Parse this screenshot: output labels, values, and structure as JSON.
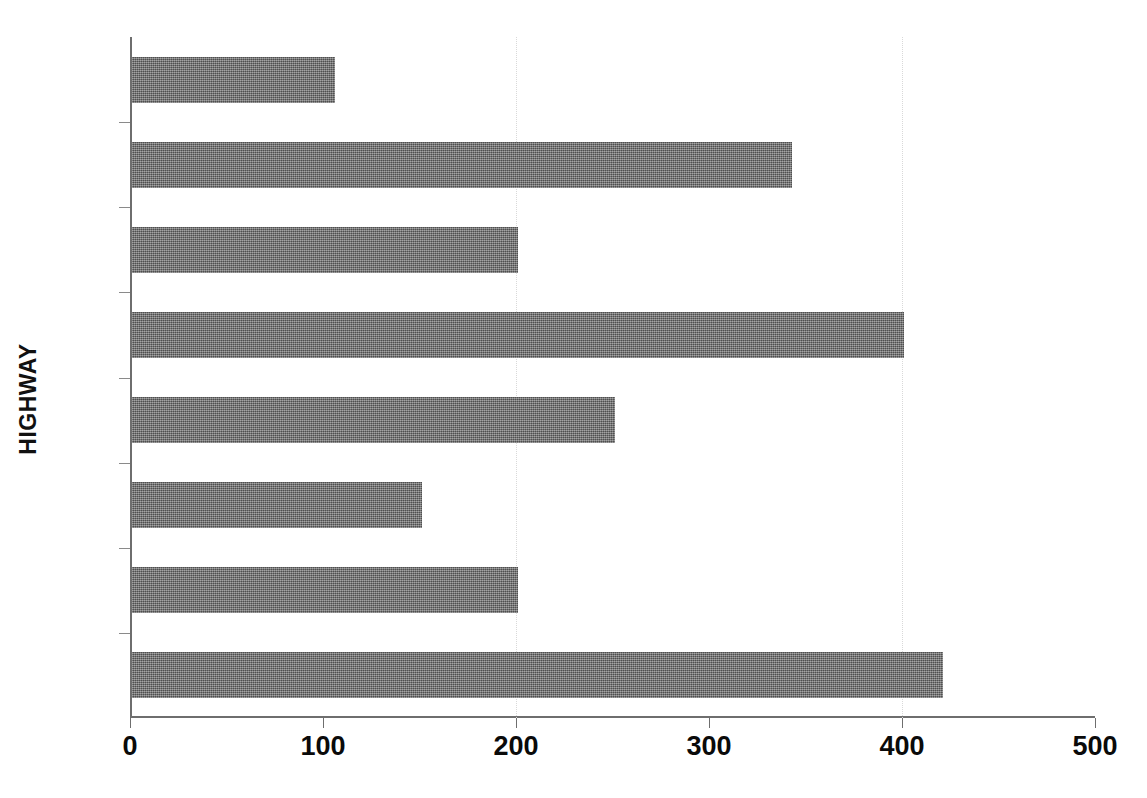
{
  "chart_data": {
    "type": "bar",
    "orientation": "horizontal",
    "title": "",
    "xlabel": "",
    "ylabel": "HIGHWAY",
    "categories": [
      "H-1",
      "H-2",
      "H-3",
      "H-4",
      "H-5",
      "H-6",
      "H-7",
      "H-8"
    ],
    "values": [
      420,
      200,
      150,
      250,
      400,
      200,
      342,
      105
    ],
    "xlim": [
      0,
      500
    ],
    "xticks": [
      0,
      100,
      200,
      300,
      400,
      500
    ],
    "xtick_labels": [
      "0",
      "100",
      "200",
      "300",
      "400",
      "500"
    ],
    "gridlines": {
      "vertical": [
        200,
        400
      ],
      "horizontal": false
    },
    "legend": null,
    "bar_color": "#6d6d6d",
    "axis_color": "#6e6e6e",
    "grid_color": "#d9d9d9",
    "text_color": "#0a0a0a"
  },
  "axis": {
    "y_title": "HIGHWAY"
  }
}
